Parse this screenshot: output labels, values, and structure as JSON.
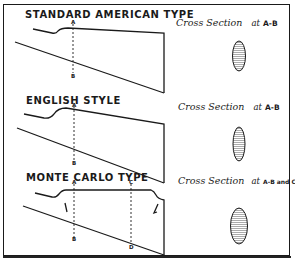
{
  "diagram": {
    "colors": {
      "ink": "#1a1a1a",
      "hatch": "#555555",
      "background": "#ffffff"
    },
    "panels": [
      {
        "title": "STANDARD AMERICAN TYPE",
        "cross_section_label": "Cross Section",
        "cross_section_at": "at",
        "cross_section_ref": "A-B",
        "points": {
          "top": "A",
          "bottom": "B"
        }
      },
      {
        "title": "ENGLISH STYLE",
        "cross_section_label": "Cross Section",
        "cross_section_at": "at",
        "cross_section_ref": "A-B",
        "points": {
          "top": "A",
          "bottom": "B"
        }
      },
      {
        "title": "MONTE CARLO TYPE",
        "cross_section_label": "Cross Section",
        "cross_section_at": "at",
        "cross_section_ref": "A-B and C-D",
        "points": {
          "top": "A",
          "bottom": "B",
          "top2": "C",
          "bottom2": "D"
        }
      }
    ]
  }
}
